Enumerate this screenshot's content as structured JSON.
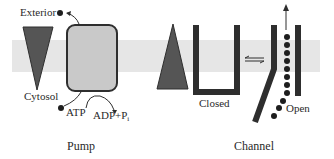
{
  "membrane": {
    "color": "#e6e6e6"
  },
  "colors": {
    "dark": "#2e2e2e",
    "pump_fill": "#c9c9c9",
    "triangle_fill": "#555555"
  },
  "pump": {
    "caption": "Pump",
    "exterior_label": "Exterior",
    "cytosol_label": "Cytosol",
    "atp_label": "ATP",
    "adp_label": "ADP+P",
    "adp_subscript": "i"
  },
  "channel": {
    "caption": "Channel",
    "closed_label": "Closed",
    "open_label": "Open",
    "equilibrium_symbol": "⇌"
  }
}
